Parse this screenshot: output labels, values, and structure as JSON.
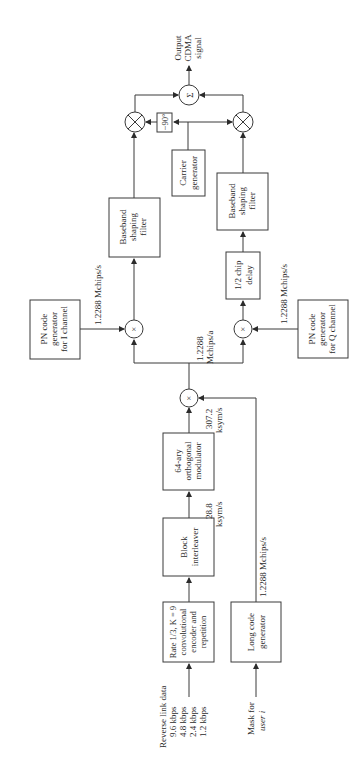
{
  "inputs": {
    "data": {
      "line1": "Reverse link data",
      "rates": [
        "9.6 kbps",
        "4.8 kbps",
        "2.4 kbps",
        "1.2 kbps"
      ]
    },
    "mask": {
      "line1": "Mask for",
      "line2": "user i"
    }
  },
  "blocks": {
    "encoder": {
      "lines": [
        "Rate 1/3, K = 9",
        "convolutional",
        "encoder and",
        "repetition"
      ]
    },
    "interleaver": {
      "lines": [
        "Block",
        "interleaver"
      ]
    },
    "modulator": {
      "lines": [
        "64-ary",
        "orthogonal",
        "modulator"
      ]
    },
    "long_code": {
      "lines": [
        "Long code",
        "generator"
      ]
    },
    "pn_i": {
      "lines": [
        "PN code",
        "generator",
        "for I channel"
      ]
    },
    "pn_q": {
      "lines": [
        "PN code",
        "generator",
        "for Q channel"
      ]
    },
    "chip_delay": {
      "lines": [
        "1/2 chip",
        "delay"
      ]
    },
    "baseband_i": {
      "lines": [
        "Baseband",
        "shaping",
        "filter"
      ]
    },
    "baseband_q": {
      "lines": [
        "Baseband",
        "shaping",
        "filter"
      ]
    },
    "carrier": {
      "lines": [
        "Carrier",
        "generator"
      ]
    },
    "phase_shift": {
      "label": "−90°"
    }
  },
  "rates": {
    "after_encoder": {
      "line1": "28.8",
      "line2": "ksym/s"
    },
    "after_modulator": {
      "line1": "307.2",
      "line2": "ksym/s"
    },
    "long_code": "1.2288 Mchips/s",
    "after_spread": {
      "line1": "1.2288",
      "line2": "Mchips/a"
    },
    "pn_i": "1.2288 Mchips/s",
    "pn_q": "1.2288 Mchips/s"
  },
  "symbols": {
    "multiply": "×",
    "sum": "Σ"
  },
  "output": {
    "lines": [
      "Output",
      "CDMA",
      "signal"
    ]
  }
}
